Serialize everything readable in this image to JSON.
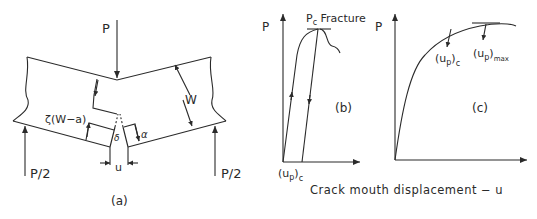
{
  "panel_a": {
    "load_label": "P",
    "support_left_label": "P/2",
    "support_right_label": "P/2",
    "depth_label": "W",
    "hinge_label": "ζ(W−a)",
    "delta_label": "δ",
    "alpha_label": "α",
    "cmod_label": "u",
    "caption": "(a)"
  },
  "panel_b": {
    "y_axis_label": "P",
    "peak_label_main": "P",
    "peak_label_sub": "c",
    "peak_label_suffix": " Fracture",
    "x_marker_main": "(u",
    "x_marker_sub": "p",
    "x_marker_close": ")",
    "x_marker_sub2": "c",
    "caption": "(b)"
  },
  "panel_c": {
    "y_axis_label": "P",
    "marker1_main": "(u",
    "marker1_sub": "p",
    "marker1_close": ")",
    "marker1_sub2": "c",
    "marker2_main": "(u",
    "marker2_sub": "p",
    "marker2_close": ")",
    "marker2_sub2": "max",
    "caption": "(c)"
  },
  "shared": {
    "x_axis_label": "Crack mouth displacement  − u"
  },
  "colors": {
    "line": "#2a2a2a",
    "background": "#ffffff"
  }
}
